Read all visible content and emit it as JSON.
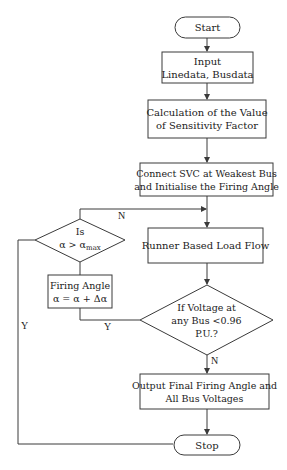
{
  "flowchart": {
    "start": "Start",
    "input": {
      "line1": "Input",
      "line2": "Linedata, Busdata"
    },
    "calc": {
      "line1": "Calculation of the Value",
      "line2": "of Sensitivity Factor"
    },
    "connect": {
      "line1": "Connect SVC at Weakest Bus",
      "line2": "and Initialise the Firing Angle"
    },
    "runner": "Runner Based Load Flow",
    "voltage_decision": {
      "line1": "If Voltage at",
      "line2": "any Bus <0.96",
      "line3": "P.U.?"
    },
    "alpha_decision": {
      "line1": "Is",
      "line2_main": "α > α",
      "line2_sub": "max"
    },
    "firing": {
      "line1": "Firing Angle",
      "line2": "α = α + Δα"
    },
    "output": {
      "line1": "Output Final Firing Angle and",
      "line2": "All Bus Voltages"
    },
    "stop": "Stop",
    "edge_labels": {
      "alpha_no": "N",
      "alpha_yes": "Y",
      "voltage_yes": "Y",
      "voltage_no": "N"
    }
  }
}
